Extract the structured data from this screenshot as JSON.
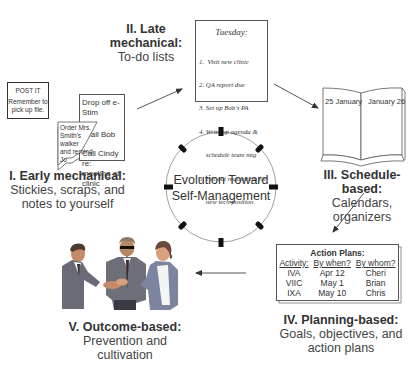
{
  "center": {
    "line1": "Evolution Toward",
    "line2": "Self-Management"
  },
  "stages": [
    {
      "title": "I. Early mechanical:",
      "subtitle_lines": [
        "Stickies, scraps, and",
        "notes to yourself"
      ],
      "post_it": {
        "heading": "POST IT",
        "lines": [
          "Remember to",
          "pick up file."
        ]
      },
      "scrap_note": {
        "lines": [
          "Order Mrs.",
          "Smith's walker",
          "and remind",
          "Jo"
        ]
      },
      "note_pad": {
        "line1": "Drop off e-Stim",
        "line2": "Call Bob",
        "line3": "Call Cindy re:",
        "line4": "meeting at clinic"
      }
    },
    {
      "title": "II. Late mechanical:",
      "subtitle_lines": [
        "To-do lists"
      ],
      "todo": {
        "heading": "Tuesday:",
        "items": [
          "1.  Visit new clinic",
          "2. QA report due",
          "3. Set up Bob's PA",
          "4. Write up agenda &",
          "    schedule team mtg",
          "5. Fill out requisition for",
          "    new tech position"
        ]
      }
    },
    {
      "title": "III. Schedule-based:",
      "subtitle_lines": [
        "Calendars, organizers"
      ],
      "calendar": {
        "left_page": "25 January",
        "right_page": "January 26"
      }
    },
    {
      "title": "IV. Planning-based:",
      "subtitle_lines": [
        "Goals, objectives, and",
        "action plans"
      ],
      "action_plans": {
        "heading": "Action Plans:",
        "columns": [
          "Activity:",
          "By when?",
          "By whom?"
        ],
        "rows": [
          [
            "IVA",
            "Apr 12",
            "Cheri"
          ],
          [
            "VIIC",
            "May 1",
            "Brian"
          ],
          [
            "IXA",
            "May 10",
            "Chris"
          ]
        ]
      }
    },
    {
      "title": "V. Outcome-based:",
      "subtitle_lines": [
        "Prevention and",
        "cultivation"
      ],
      "illustration": "handshake-people-illustration"
    }
  ],
  "colors": {
    "line": "#555555",
    "text": "#333333",
    "circle": "#888888",
    "tick": "#111111"
  }
}
